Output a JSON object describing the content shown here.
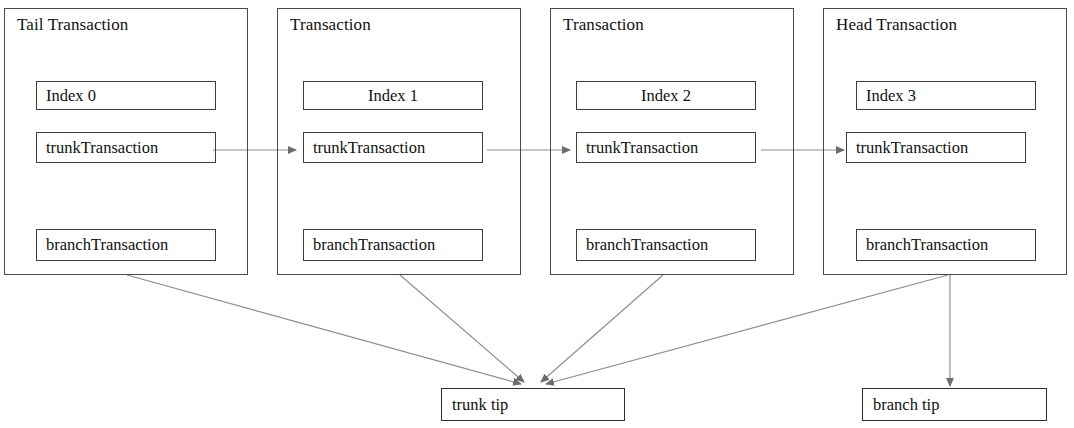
{
  "diagram": {
    "stroke_color": "#4a4a4a",
    "text_color": "#111111",
    "background": "#ffffff"
  },
  "transactions": [
    {
      "id": "tail",
      "title": "Tail Transaction",
      "index_label": "Index 0",
      "index_align": "left",
      "trunk_label": "trunkTransaction",
      "branch_label": "branchTransaction"
    },
    {
      "id": "middle-1",
      "title": "Transaction",
      "index_label": "Index 1",
      "index_align": "center",
      "trunk_label": "trunkTransaction",
      "branch_label": "branchTransaction"
    },
    {
      "id": "middle-2",
      "title": "Transaction",
      "index_label": "Index 2",
      "index_align": "center",
      "trunk_label": "trunkTransaction",
      "branch_label": "branchTransaction"
    },
    {
      "id": "head",
      "title": "Head Transaction",
      "index_label": "Index 3",
      "index_align": "left",
      "trunk_label": "trunkTransaction",
      "branch_label": "branchTransaction"
    }
  ],
  "tips": [
    {
      "id": "trunk-tip",
      "label": "trunk tip"
    },
    {
      "id": "branch-tip",
      "label": "branch tip"
    }
  ],
  "edges": {
    "trunk_chain": [
      {
        "from": "tail.trunkTransaction",
        "to": "middle-1.trunkTransaction"
      },
      {
        "from": "middle-1.trunkTransaction",
        "to": "middle-2.trunkTransaction"
      },
      {
        "from": "middle-2.trunkTransaction",
        "to": "head.trunkTransaction"
      }
    ],
    "to_trunk_tip": [
      {
        "from": "tail",
        "to": "trunk tip"
      },
      {
        "from": "middle-1",
        "to": "trunk tip"
      },
      {
        "from": "middle-2",
        "to": "trunk tip"
      },
      {
        "from": "head",
        "to": "trunk tip"
      }
    ],
    "to_branch_tip": [
      {
        "from": "head",
        "to": "branch tip"
      }
    ]
  }
}
